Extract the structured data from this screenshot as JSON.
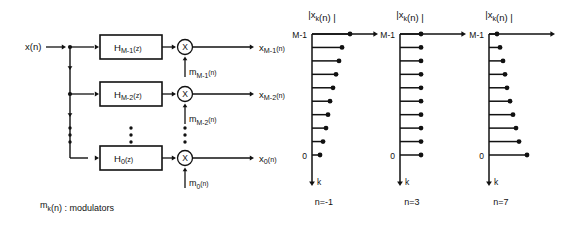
{
  "figure": {
    "background_color": "#ffffff",
    "line_color": "#111111",
    "left_panel": {
      "input_label": "x(n)",
      "caption": "m",
      "caption_sub": "k",
      "caption_rest": "(n) : modulators",
      "branches": [
        {
          "filter_base": "H",
          "filter_sub": "M-1",
          "filter_sup": "(z)",
          "multiplier_symbol": "X",
          "modulator_base": "m",
          "modulator_sub": "M-1",
          "modulator_sup": "(n)",
          "output_base": "x",
          "output_sub": "M-1",
          "output_sup": "(n)"
        },
        {
          "filter_base": "H",
          "filter_sub": "M-2",
          "filter_sup": "(z)",
          "multiplier_symbol": "X",
          "modulator_base": "m",
          "modulator_sub": "M-2",
          "modulator_sup": "(n)",
          "output_base": "x",
          "output_sub": "M-2",
          "output_sup": "(n)"
        },
        {
          "filter_base": "H",
          "filter_sub": "0",
          "filter_sup": "(z)",
          "multiplier_symbol": "X",
          "modulator_base": "m",
          "modulator_sub": "0",
          "modulator_sup": "(n)",
          "output_base": "x",
          "output_sub": "0",
          "output_sup": "(n)"
        }
      ],
      "ellipsis_dot_count": 3
    },
    "right_panel": {
      "plot_title_base": "|x",
      "plot_title_sub": "k",
      "plot_title_rest": "(n) |",
      "axis_top_label": "M-1",
      "axis_bottom_label": "0",
      "axis_arrow_label": "k",
      "plots": [
        {
          "caption": "n=-1"
        },
        {
          "caption": "n=3"
        },
        {
          "caption": "n=7"
        }
      ]
    }
  },
  "chart_data": {
    "type": "bar",
    "xlabel": "k",
    "ylabel": "|x_k(n)|",
    "ytick_labels": [
      "M-1",
      "0"
    ],
    "orientation": "horizontal",
    "k_axis_direction": "downward",
    "grid": false,
    "legend": false,
    "series": [
      {
        "name": "n=-1",
        "categories": [
          "M-1",
          "M-2",
          "M-3",
          "M-4",
          "M-5",
          "M-6",
          "M-7",
          "M-8",
          "M-9",
          "0"
        ],
        "values": [
          38,
          30,
          27,
          24,
          21,
          18,
          16,
          14,
          11,
          8
        ]
      },
      {
        "name": "n=3",
        "categories": [
          "M-1",
          "M-2",
          "M-3",
          "M-4",
          "M-5",
          "M-6",
          "M-7",
          "M-8",
          "M-9",
          "0"
        ],
        "values": [
          21,
          21,
          21,
          21,
          21,
          21,
          21,
          21,
          21,
          21
        ]
      },
      {
        "name": "n=7",
        "categories": [
          "M-1",
          "M-2",
          "M-3",
          "M-4",
          "M-5",
          "M-6",
          "M-7",
          "M-8",
          "M-9",
          "0"
        ],
        "values": [
          8,
          11,
          14,
          16,
          18,
          21,
          24,
          27,
          30,
          38
        ]
      }
    ]
  }
}
